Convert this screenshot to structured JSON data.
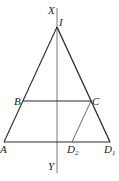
{
  "diagram": {
    "labels": {
      "X": "X",
      "Y": "Y",
      "I": "I",
      "A": "A",
      "B": "B",
      "C": "C",
      "D2_main": "D",
      "D2_sub": "2",
      "D1_main": "D",
      "D1_sub": "1"
    },
    "points": {
      "I": [
        57,
        27
      ],
      "A": [
        4,
        142
      ],
      "B": [
        23,
        101
      ],
      "C": [
        91,
        101
      ],
      "D1": [
        110,
        142
      ],
      "D2": [
        72,
        142
      ],
      "X_end": [
        57,
        8
      ],
      "Y_end": [
        57,
        173
      ]
    },
    "segments": [
      "I-A",
      "I-D1",
      "B-C",
      "A-D1",
      "C-D2",
      "X-Y"
    ],
    "colors": {
      "line": "#2a2a2a",
      "background": "#ffffff"
    }
  }
}
